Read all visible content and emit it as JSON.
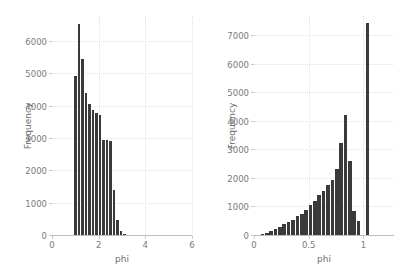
{
  "chart_data": [
    {
      "id": "left",
      "type": "bar",
      "title": "",
      "xlabel": "phi",
      "ylabel": "Frequency",
      "xlim": [
        0,
        6
      ],
      "ylim": [
        0,
        6800
      ],
      "xticks": [
        0,
        2,
        4,
        6
      ],
      "xtick_labels": [
        "0",
        "2",
        "4",
        "6"
      ],
      "yticks": [
        0,
        1000,
        2000,
        3000,
        4000,
        5000,
        6000
      ],
      "ytick_labels": [
        "0",
        "1000",
        "2000",
        "3000",
        "4000",
        "5000",
        "6000"
      ],
      "grid": true,
      "legend": "none",
      "bin_width": 0.15,
      "bin_starts": [
        0.95,
        1.1,
        1.25,
        1.4,
        1.55,
        1.7,
        1.85,
        2.0,
        2.15,
        2.3,
        2.45,
        2.6,
        2.75,
        2.9,
        3.05,
        3.2,
        3.35,
        3.5,
        3.95,
        4.4
      ],
      "values": [
        4960,
        6550,
        5470,
        4430,
        4080,
        3900,
        3800,
        3740,
        2980,
        2960,
        2950,
        1420,
        480,
        150,
        55,
        30,
        20,
        15,
        12,
        10
      ]
    },
    {
      "id": "right",
      "type": "bar",
      "title": "",
      "xlabel": "phi",
      "ylabel": "Frequency",
      "xlim": [
        0,
        1.28
      ],
      "ylim": [
        0,
        7700
      ],
      "xticks": [
        0,
        0.5,
        1
      ],
      "xtick_labels": [
        "0",
        "0.5",
        "1"
      ],
      "yticks": [
        0,
        1000,
        2000,
        3000,
        4000,
        5000,
        6000,
        7000
      ],
      "ytick_labels": [
        "0",
        "1000",
        "2000",
        "3000",
        "4000",
        "5000",
        "6000",
        "7000"
      ],
      "grid": true,
      "legend": "none",
      "bin_width": 0.04,
      "bin_starts": [
        0.06,
        0.1,
        0.14,
        0.18,
        0.22,
        0.26,
        0.3,
        0.34,
        0.38,
        0.42,
        0.46,
        0.5,
        0.54,
        0.58,
        0.62,
        0.66,
        0.7,
        0.74,
        0.78,
        0.82,
        0.86,
        0.9,
        0.94,
        0.98,
        1.02
      ],
      "values": [
        60,
        90,
        170,
        240,
        320,
        420,
        500,
        560,
        700,
        760,
        900,
        1080,
        1230,
        1420,
        1560,
        1800,
        1960,
        2340,
        3270,
        4250,
        2630,
        860,
        540,
        40,
        7450
      ]
    }
  ]
}
